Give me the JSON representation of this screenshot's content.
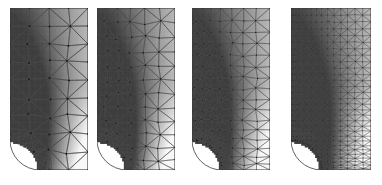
{
  "figure": {
    "type": "mesh-refinement-sequence",
    "domain_shape": "rectangular-plate-with-quarter-circular-notch",
    "panel_count": 4,
    "background_color": "#ffffff",
    "mesh_line_color": "#4a4a4a",
    "mesh_node_color": "#151515",
    "field_rendering": "grayscale-scalar-field",
    "field_dark_value": "#4d4d4d",
    "field_mid_value": "#9a9a9a",
    "field_light_value": "#f2f2f2",
    "geometry": {
      "plate_width": 78,
      "plate_height": 162,
      "notch_radius": 30,
      "notch_center_x": 0,
      "notch_center_y": 162,
      "notch_description": "quarter circle removed from lower-left corner"
    },
    "panels": [
      {
        "index": 1,
        "label": "",
        "refinement_level": 1,
        "x": 10,
        "y": 8,
        "width": 78,
        "height": 162,
        "cols": 4,
        "rows": 9,
        "node_count": 55,
        "element_count": 84,
        "jitter": 2.6,
        "refine_notch": false,
        "notch_bands": 1,
        "seed": 11
      },
      {
        "index": 2,
        "label": "",
        "refinement_level": 2,
        "x": 97,
        "y": 8,
        "width": 78,
        "height": 162,
        "cols": 6,
        "rows": 12,
        "node_count": 104,
        "element_count": 170,
        "jitter": 2.0,
        "refine_notch": true,
        "notch_bands": 2,
        "seed": 23
      },
      {
        "index": 3,
        "label": "",
        "refinement_level": 3,
        "x": 192,
        "y": 8,
        "width": 78,
        "height": 162,
        "cols": 8,
        "rows": 16,
        "node_count": 178,
        "element_count": 306,
        "jitter": 1.4,
        "refine_notch": true,
        "notch_bands": 3,
        "seed": 37
      },
      {
        "index": 4,
        "label": "",
        "refinement_level": 4,
        "x": 291,
        "y": 8,
        "width": 80,
        "height": 162,
        "cols": 16,
        "rows": 30,
        "node_count": 620,
        "element_count": 1140,
        "jitter": 0.5,
        "refine_notch": true,
        "notch_bands": 5,
        "seed": 53
      }
    ],
    "field_data": {
      "description": "scalar stress magnitude, high near notch boundary and left edge",
      "sources": [
        {
          "x": 0.0,
          "y": 0.88,
          "weight": 1.0,
          "falloff": 0.42
        },
        {
          "x": 0.0,
          "y": 0.55,
          "weight": 0.62,
          "falloff": 0.5
        },
        {
          "x": 0.3,
          "y": 1.0,
          "weight": 0.55,
          "falloff": 0.34
        },
        {
          "x": 0.0,
          "y": 0.2,
          "weight": 0.4,
          "falloff": 0.62
        }
      ],
      "base_level": 0.46,
      "top_level": 0.52,
      "bottom_right_level": 0.04
    }
  }
}
